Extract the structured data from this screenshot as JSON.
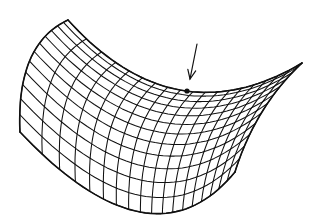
{
  "figure": {
    "type": "saddle-surface-wireframe",
    "stroke_color": "#111111",
    "background": "#ffffff",
    "grid": {
      "u_lines": 13,
      "v_lines": 19,
      "corners": {
        "back_left": [
          68,
          20
        ],
        "back_right": [
          302,
          63
        ],
        "front_left": [
          20,
          132
        ],
        "front_right": [
          235,
          172
        ]
      },
      "edge_controls": {
        "back_mid": [
          180,
          90
        ],
        "front_mid": [
          140,
          212
        ],
        "left_mid": [
          30,
          60
        ],
        "right_mid": [
          262,
          112
        ]
      }
    },
    "annotations": {
      "arrow": {
        "from": [
          197,
          44
        ],
        "to": [
          190,
          79
        ]
      },
      "saddle_point": {
        "x": 187,
        "y": 91,
        "r": 2.6
      }
    }
  }
}
